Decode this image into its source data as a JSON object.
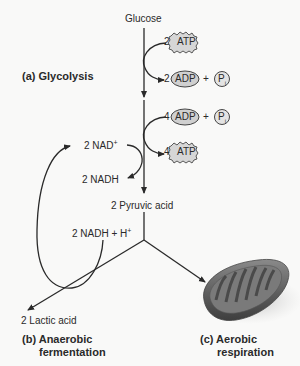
{
  "diagram": {
    "start": "Glucose",
    "sections": {
      "glycolysis": "(a) Glycolysis",
      "anaerobic_line1": "(b) Anaerobic",
      "anaerobic_line2": "fermentation",
      "aerobic_line1": "(c) Aerobic",
      "aerobic_line2": "respiration"
    },
    "glycolysis_inputs": {
      "atp_in_count": "2",
      "atp_in_label": "ATP",
      "adp_out_count": "2",
      "adp_out_label": "ADP",
      "pi_label": "P",
      "pi_sub": "i",
      "plus": "+"
    },
    "glycolysis_outputs": {
      "adp_in_count": "4",
      "adp_in_label": "ADP",
      "pi_label": "P",
      "pi_sub": "i",
      "plus": "+",
      "atp_out_count": "4",
      "atp_out_label": "ATP"
    },
    "nad": {
      "nad_plus": "2 NAD",
      "nad_plus_sup": "+",
      "nadh": "2 NADH"
    },
    "pyruvic": "2 Pyruvic acid",
    "nadh_h": "2 NADH + H",
    "nadh_h_sup": "+",
    "lactic": "2 Lactic acid",
    "colors": {
      "ink": "#2a2a2a",
      "background": "#f9f9f8",
      "mitochondrion": "#6a6a6a"
    }
  }
}
